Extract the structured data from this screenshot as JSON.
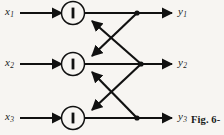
{
  "figure": {
    "caption": "Fig. 6-",
    "background_color": "#f7f5f2",
    "ink_color": "#111111"
  },
  "inputs": [
    {
      "name": "x",
      "subscript": "1",
      "row": 1
    },
    {
      "name": "x",
      "subscript": "2",
      "row": 2
    },
    {
      "name": "x",
      "subscript": "3",
      "row": 3
    }
  ],
  "outputs": [
    {
      "name": "y",
      "subscript": "1",
      "row": 1
    },
    {
      "name": "y",
      "subscript": "2",
      "row": 2
    },
    {
      "name": "y",
      "subscript": "3",
      "row": 3
    }
  ],
  "nodes": [
    {
      "id": "node-1",
      "symbol": "I",
      "row": 1
    },
    {
      "id": "node-2",
      "symbol": "I",
      "row": 2
    },
    {
      "id": "node-3",
      "symbol": "I",
      "row": 3
    }
  ],
  "edges": [
    {
      "id": "input-1-to-node-1",
      "from": "x1",
      "to": "node-1",
      "kind": "input"
    },
    {
      "id": "input-2-to-node-2",
      "from": "x2",
      "to": "node-2",
      "kind": "input"
    },
    {
      "id": "input-3-to-node-3",
      "from": "x3",
      "to": "node-3",
      "kind": "input"
    },
    {
      "id": "node-1-to-output-1",
      "from": "node-1",
      "to": "y1",
      "kind": "output"
    },
    {
      "id": "node-2-to-output-2",
      "from": "node-2",
      "to": "y2",
      "kind": "output"
    },
    {
      "id": "node-3-to-output-3",
      "from": "node-3",
      "to": "y3",
      "kind": "output"
    },
    {
      "id": "cross-junction-1-to-node-2",
      "from": "junction-1",
      "to": "node-2",
      "kind": "cross-feedback"
    },
    {
      "id": "cross-junction-2-to-node-1",
      "from": "junction-2",
      "to": "node-1",
      "kind": "cross-feedback"
    },
    {
      "id": "cross-junction-2-to-node-3",
      "from": "junction-2",
      "to": "node-3",
      "kind": "cross-feedback"
    },
    {
      "id": "cross-junction-3-to-node-2",
      "from": "junction-3",
      "to": "node-2",
      "kind": "cross-feedback"
    }
  ],
  "junctions": [
    {
      "id": "junction-1",
      "row": 1
    },
    {
      "id": "junction-2",
      "row": 2
    },
    {
      "id": "junction-3",
      "row": 3
    }
  ]
}
